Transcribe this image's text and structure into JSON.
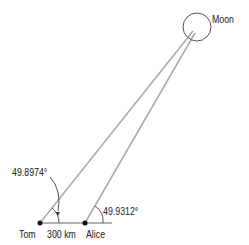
{
  "diagram": {
    "moon_label": "Moon",
    "tom_label": "Tom",
    "alice_label": "Alice",
    "baseline_label": "300 km",
    "tom_angle": "49.8974°",
    "alice_angle": "49.9312°"
  },
  "colors": {
    "line": "#aaaaaa",
    "text": "#222222",
    "point": "#111111"
  }
}
